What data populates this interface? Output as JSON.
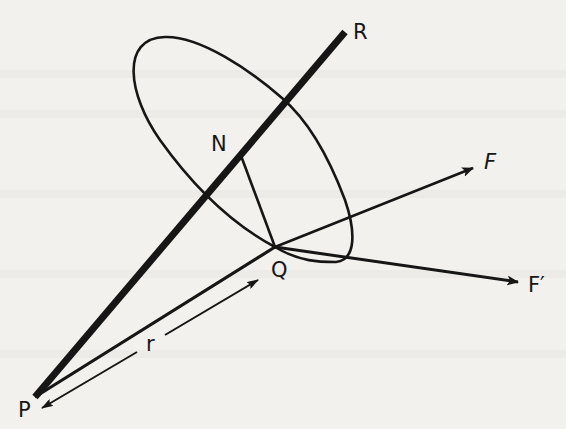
{
  "diagram": {
    "colors": {
      "background": "#f2f1ee",
      "ink": "#161616"
    },
    "points": {
      "P": {
        "label": "P",
        "x": 35,
        "y": 397
      },
      "R": {
        "label": "R",
        "x": 345,
        "y": 32
      },
      "N": {
        "label": "N",
        "x": 240,
        "y": 153
      },
      "Q": {
        "label": "Q",
        "x": 275,
        "y": 247
      }
    },
    "vectors": {
      "F": {
        "label": "F",
        "from": "Q",
        "to": [
          473,
          168
        ]
      },
      "F_prime": {
        "label": "F′",
        "from": "Q",
        "to": [
          518,
          282
        ]
      }
    },
    "distance": {
      "label": "r",
      "between": [
        "P",
        "Q"
      ]
    },
    "labels": {
      "P": "P",
      "R": "R",
      "N": "N",
      "Q": "Q",
      "F": "F",
      "F_prime": "F′",
      "r": "r"
    }
  }
}
